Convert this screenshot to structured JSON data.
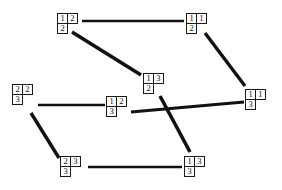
{
  "diagram": {
    "background_color": "#ffffff",
    "line_color": "#111111",
    "nodes": [
      {
        "id": "n1",
        "name": "node-12-2",
        "x": 57,
        "y": 13,
        "rows": [
          [
            "1",
            "2"
          ],
          [
            "2"
          ]
        ]
      },
      {
        "id": "n2",
        "name": "node-11-2",
        "x": 186,
        "y": 13,
        "rows": [
          [
            "1",
            "1"
          ],
          [
            "2"
          ]
        ]
      },
      {
        "id": "n3",
        "name": "node-13-2",
        "x": 143,
        "y": 73,
        "rows": [
          [
            "1",
            "3"
          ],
          [
            "2"
          ]
        ]
      },
      {
        "id": "n4",
        "name": "node-22-3",
        "x": 12,
        "y": 84,
        "rows": [
          [
            "2",
            "2"
          ],
          [
            "3"
          ]
        ]
      },
      {
        "id": "n5",
        "name": "node-12-3",
        "x": 106,
        "y": 96,
        "rows": [
          [
            "1",
            "2"
          ],
          [
            "3"
          ]
        ]
      },
      {
        "id": "n6",
        "name": "node-11-3",
        "x": 245,
        "y": 89,
        "rows": [
          [
            "1",
            "1"
          ],
          [
            "3"
          ]
        ]
      },
      {
        "id": "n7",
        "name": "node-23-3",
        "x": 60,
        "y": 156,
        "rows": [
          [
            "2",
            "3"
          ],
          [
            "3"
          ]
        ]
      },
      {
        "id": "n8",
        "name": "node-13-3",
        "x": 184,
        "y": 156,
        "rows": [
          [
            "1",
            "3"
          ],
          [
            "3"
          ]
        ]
      }
    ],
    "edges": [
      {
        "name": "edge-12-2--11-2",
        "from": "n1",
        "to": "n2",
        "x1": 82,
        "y1": 21,
        "x2": 184,
        "y2": 21,
        "width": 2.6
      },
      {
        "name": "edge-12-2--13-2",
        "from": "n1",
        "to": "n3",
        "x1": 72,
        "y1": 32,
        "x2": 141,
        "y2": 75,
        "width": 3.6
      },
      {
        "name": "edge-11-2--11-3",
        "from": "n2",
        "to": "n6",
        "x1": 205,
        "y1": 33,
        "x2": 245,
        "y2": 86,
        "width": 3.4
      },
      {
        "name": "edge-22-3--12-3",
        "from": "n4",
        "to": "n5",
        "x1": 38,
        "y1": 105,
        "x2": 105,
        "y2": 105,
        "width": 2.6
      },
      {
        "name": "edge-22-3--23-3",
        "from": "n4",
        "to": "n7",
        "x1": 31,
        "y1": 113,
        "x2": 59,
        "y2": 158,
        "width": 3.4
      },
      {
        "name": "edge-12-3--11-3",
        "from": "n5",
        "to": "n6",
        "x1": 131,
        "y1": 112,
        "x2": 244,
        "y2": 102,
        "width": 3.0
      },
      {
        "name": "edge-13-2--13-3",
        "from": "n3",
        "to": "n8",
        "x1": 160,
        "y1": 96,
        "x2": 190,
        "y2": 152,
        "width": 3.6
      },
      {
        "name": "edge-23-3--13-3",
        "from": "n7",
        "to": "n8",
        "x1": 88,
        "y1": 167,
        "x2": 182,
        "y2": 167,
        "width": 2.6
      }
    ]
  }
}
